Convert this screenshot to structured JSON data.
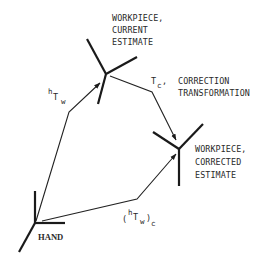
{
  "diagram": {
    "frames": {
      "current": {
        "label_lines": [
          "WORKPIECE,",
          "CURRENT",
          "ESTIMATE"
        ]
      },
      "corrected": {
        "label_lines": [
          "WORKPIECE,",
          "CORRECTED",
          "ESTIMATE"
        ]
      },
      "hand": {
        "label": "HAND"
      }
    },
    "transforms": {
      "hTw": {
        "pre_sup": "h",
        "main": "T",
        "sub": "w"
      },
      "Tc": {
        "main": "T",
        "sub": "c",
        "suffix": ",",
        "desc_lines": [
          "CORRECTION",
          "TRANSFORMATION"
        ]
      },
      "hTw_c": {
        "open": "(",
        "pre_sup": "h",
        "main": "T",
        "sub": "w",
        "close": ")",
        "outer_sub": "c"
      }
    },
    "colors": {
      "ink": "#1a1a1a",
      "background": "#ffffff"
    }
  }
}
